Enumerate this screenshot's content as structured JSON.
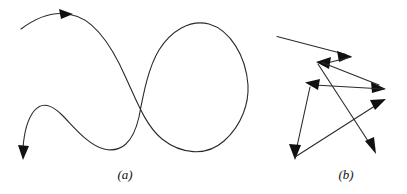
{
  "figure": {
    "background_color": "#ffffff",
    "stroke_color": "#2b2b2b",
    "arrow_fill_color": "#111111",
    "stroke_width": 1,
    "width": 407,
    "height": 194
  },
  "panels": [
    {
      "id": "a",
      "caption": "(a)",
      "kind": "smooth-curve",
      "description": "continuous smooth curve with an S bend and a large closed loop",
      "arrowheads": [
        {
          "name": "arrow-top-left",
          "x": 66,
          "y": 14,
          "angle": -12
        },
        {
          "name": "arrow-bottom-left",
          "x": 24,
          "y": 158,
          "angle": 108
        }
      ],
      "path": "M 22 29 C 36 20 52 13 66 14 C 92 16 112 44 128 78 C 140 104 150 128 166 140 C 184 154 206 156 222 142 C 240 126 248 104 247 86 C 245 58 230 33 210 26 C 192 20 172 30 160 48 C 148 66 142 96 138 118 C 132 144 120 152 104 148 C 88 144 74 126 62 114 C 52 104 42 100 34 110 C 27 119 24 136 23 152",
      "label_position": {
        "x": 125,
        "y": 177
      }
    },
    {
      "id": "b",
      "caption": "(b)",
      "kind": "polyline",
      "description": "angular zigzag polyline with six arrowheads crossing itself",
      "segments": [
        {
          "name": "segment-1",
          "x1": 278,
          "y1": 37,
          "x2": 350,
          "y2": 56
        },
        {
          "name": "segment-2",
          "x1": 350,
          "y1": 56,
          "x2": 318,
          "y2": 64
        },
        {
          "name": "segment-3",
          "x1": 322,
          "y1": 62,
          "x2": 384,
          "y2": 88
        },
        {
          "name": "segment-4",
          "x1": 384,
          "y1": 88,
          "x2": 306,
          "y2": 84
        },
        {
          "name": "segment-5",
          "x1": 310,
          "y1": 86,
          "x2": 296,
          "y2": 156
        },
        {
          "name": "segment-6",
          "x1": 296,
          "y1": 156,
          "x2": 384,
          "y2": 101
        },
        {
          "name": "segment-7",
          "x1": 318,
          "y1": 63,
          "x2": 374,
          "y2": 150
        }
      ],
      "arrowheads": [
        {
          "name": "arrow-right-upper",
          "x": 350,
          "y": 56,
          "angle": 15
        },
        {
          "name": "arrow-upleft-inner",
          "x": 318,
          "y": 63,
          "angle": 200
        },
        {
          "name": "arrow-right-mid-upper",
          "x": 384,
          "y": 88,
          "angle": 25
        },
        {
          "name": "arrow-upleft-outer",
          "x": 308,
          "y": 84,
          "angle": 205
        },
        {
          "name": "arrow-bottom-left",
          "x": 296,
          "y": 157,
          "angle": 100
        },
        {
          "name": "arrow-right-mid-lower",
          "x": 384,
          "y": 101,
          "angle": -33
        },
        {
          "name": "arrow-bottom-right",
          "x": 374,
          "y": 151,
          "angle": 57
        }
      ],
      "label_position": {
        "x": 345,
        "y": 177
      }
    }
  ]
}
